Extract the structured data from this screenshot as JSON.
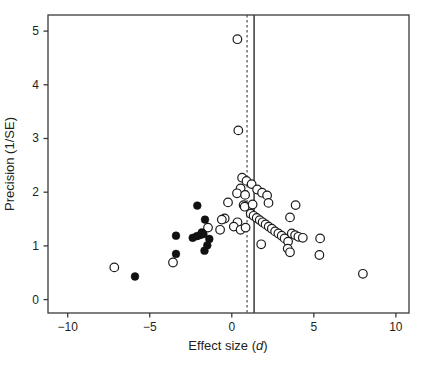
{
  "figure": {
    "ylabel": "Precision (1/SE)",
    "xlabel_prefix": "Effect size (",
    "xlabel_italic": "d",
    "xlabel_suffix": ")"
  },
  "chart_data": {
    "type": "scatter",
    "title": "",
    "xlabel": "Effect size (d)",
    "ylabel": "Precision (1/SE)",
    "xlim": [
      -11.2,
      10.8
    ],
    "ylim": [
      -0.25,
      5.3
    ],
    "x_ticks": [
      -10,
      -5,
      0,
      5,
      10
    ],
    "y_ticks": [
      0,
      1,
      2,
      3,
      4,
      5
    ],
    "grid": false,
    "legend": "none",
    "axis_color": "#3a3a3a",
    "vlines": [
      {
        "x": 0.93,
        "style": "dashed",
        "color": "#3a3a3a"
      },
      {
        "x": 1.36,
        "style": "solid",
        "color": "#3a3a3a"
      }
    ],
    "series": [
      {
        "name": "open-circles",
        "marker": "open-circle",
        "color": "#1c1c1c",
        "fill": "#ffffff",
        "points": [
          [
            0.34,
            4.85
          ],
          [
            0.4,
            3.15
          ],
          [
            0.63,
            2.27
          ],
          [
            0.9,
            2.21
          ],
          [
            1.21,
            2.15
          ],
          [
            0.54,
            2.07
          ],
          [
            1.54,
            2.05
          ],
          [
            1.85,
            1.99
          ],
          [
            2.15,
            1.94
          ],
          [
            2.24,
            1.8
          ],
          [
            0.32,
            1.98
          ],
          [
            0.81,
            1.95
          ],
          [
            -0.23,
            1.81
          ],
          [
            0.72,
            1.76
          ],
          [
            0.79,
            1.73
          ],
          [
            1.27,
            1.77
          ],
          [
            3.89,
            1.76
          ],
          [
            3.55,
            1.53
          ],
          [
            -0.43,
            1.51
          ],
          [
            -0.61,
            1.49
          ],
          [
            0.35,
            1.44
          ],
          [
            0.12,
            1.36
          ],
          [
            -1.45,
            1.34
          ],
          [
            -0.71,
            1.3
          ],
          [
            0.54,
            1.3
          ],
          [
            0.84,
            1.34
          ],
          [
            1.15,
            1.6
          ],
          [
            1.33,
            1.56
          ],
          [
            1.52,
            1.52
          ],
          [
            1.7,
            1.48
          ],
          [
            1.88,
            1.44
          ],
          [
            2.06,
            1.4
          ],
          [
            2.25,
            1.36
          ],
          [
            2.44,
            1.32
          ],
          [
            2.64,
            1.27
          ],
          [
            2.84,
            1.23
          ],
          [
            3.04,
            1.19
          ],
          [
            3.22,
            1.14
          ],
          [
            3.43,
            1.08
          ],
          [
            3.66,
            1.23
          ],
          [
            3.86,
            1.2
          ],
          [
            4.06,
            1.17
          ],
          [
            4.33,
            1.15
          ],
          [
            1.79,
            1.03
          ],
          [
            3.41,
            0.95
          ],
          [
            3.55,
            0.88
          ],
          [
            5.38,
            1.14
          ],
          [
            5.34,
            0.83
          ],
          [
            7.99,
            0.48
          ],
          [
            -3.58,
            0.69
          ],
          [
            -7.16,
            0.6
          ]
        ]
      },
      {
        "name": "filled-circles",
        "marker": "filled-circle",
        "color": "#111111",
        "fill": "#111111",
        "points": [
          [
            -2.1,
            1.75
          ],
          [
            -1.63,
            1.49
          ],
          [
            -1.83,
            1.25
          ],
          [
            -2.38,
            1.15
          ],
          [
            -2.13,
            1.18
          ],
          [
            -1.93,
            1.2
          ],
          [
            -1.73,
            1.22
          ],
          [
            -1.37,
            1.13
          ],
          [
            -3.4,
            1.19
          ],
          [
            -1.49,
            1.01
          ],
          [
            -1.66,
            0.91
          ],
          [
            -3.4,
            0.85
          ],
          [
            -5.9,
            0.43
          ]
        ]
      }
    ]
  }
}
